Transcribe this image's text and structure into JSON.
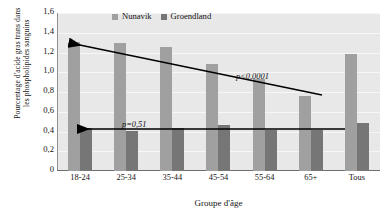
{
  "chart_data": {
    "type": "bar",
    "title": "",
    "xlabel": "Groupe d'âge",
    "ylabel": "Pourcentage d'acide gras trans dans les phospholipides sanguins",
    "ylabel_lines": [
      "Pourcentage d'acide gras trans dans",
      "les phospholipides sanguins"
    ],
    "categories": [
      "18-24",
      "25-34",
      "35-44",
      "45-54",
      "55-64",
      "65+",
      "Tous"
    ],
    "ylim": [
      0,
      1.6
    ],
    "yticks": [
      "0",
      "0,2",
      "0,4",
      "0,6",
      "0,8",
      "1,0",
      "1,2",
      "1,4",
      "1,6"
    ],
    "ytick_values": [
      0,
      0.2,
      0.4,
      0.6,
      0.8,
      1.0,
      1.2,
      1.4,
      1.6
    ],
    "grid": true,
    "legend_position": "top",
    "series": [
      {
        "name": "Nunavik",
        "color": "#a0a0a0",
        "values": [
          1.31,
          1.3,
          1.26,
          1.08,
          0.93,
          0.76,
          1.19
        ]
      },
      {
        "name": "Groendland",
        "color": "#767676",
        "values": [
          0.44,
          0.41,
          0.44,
          0.47,
          0.42,
          0.42,
          0.49
        ]
      }
    ],
    "annotations": [
      {
        "name": "p-nunavik",
        "text": "p<0,0001",
        "series": "Nunavik"
      },
      {
        "name": "p-groendland",
        "text": "p=0,51",
        "series": "Groendland"
      }
    ],
    "trendlines": [
      {
        "name": "nunavik-trend",
        "series": "Nunavik",
        "from": [
          0.76,
          5
        ],
        "to": [
          1.31,
          0
        ],
        "arrow": "left"
      },
      {
        "name": "groendland-trend",
        "series": "Groendland",
        "from": [
          0.42,
          5
        ],
        "to": [
          0.44,
          0
        ],
        "arrow": "left"
      }
    ]
  }
}
